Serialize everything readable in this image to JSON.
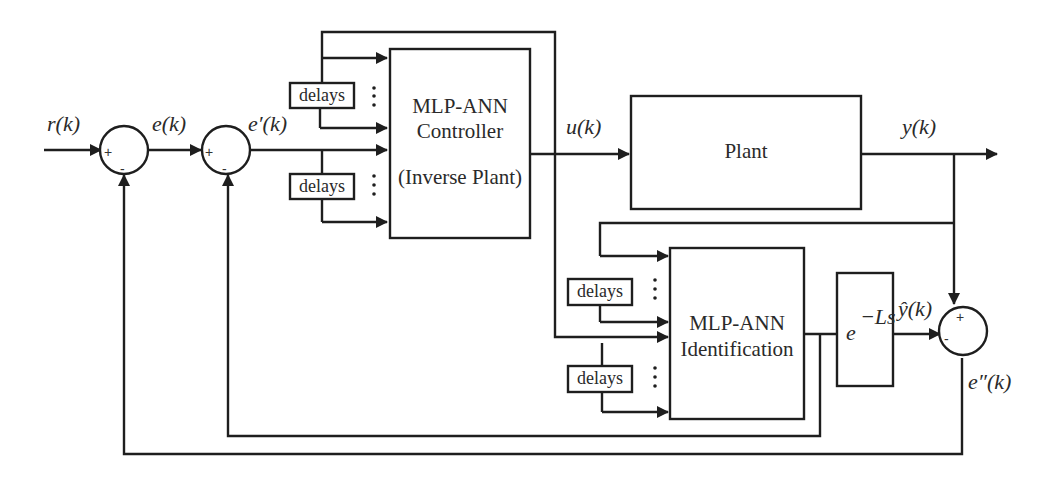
{
  "diagram": {
    "type": "block-diagram",
    "signals": {
      "reference": "r(k)",
      "error": "e(k)",
      "error_prime": "e′(k)",
      "control": "u(k)",
      "output": "y(k)",
      "estimate": "ŷ(k)",
      "error_double_prime": "e″(k)"
    },
    "blocks": {
      "controller": {
        "line1": "MLP-ANN",
        "line2": "Controller",
        "line3": "(Inverse Plant)"
      },
      "plant": {
        "label": "Plant"
      },
      "identification": {
        "line1": "MLP-ANN",
        "line2": "Identification"
      },
      "delay_tf": {
        "base": "e",
        "exponent": "−Ls"
      },
      "delays": [
        {
          "label": "delays"
        },
        {
          "label": "delays"
        },
        {
          "label": "delays"
        },
        {
          "label": "delays"
        }
      ]
    },
    "summing_junctions": [
      {
        "id": "sum1",
        "plus": "+",
        "minus": "-"
      },
      {
        "id": "sum2",
        "plus": "+",
        "minus": "-"
      },
      {
        "id": "sum3",
        "plus": "+",
        "minus": "-"
      }
    ],
    "ellipsis": "⋮"
  }
}
